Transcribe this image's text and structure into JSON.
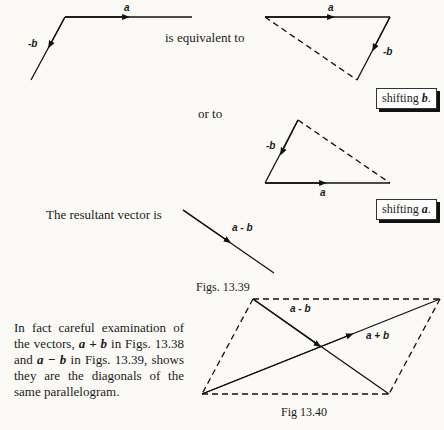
{
  "figure_1": {
    "label_a": "a",
    "label_neg_b": "-b",
    "text_equivalent": "is equivalent to"
  },
  "figure_2": {
    "label_a": "a",
    "label_neg_b": "-b",
    "note": {
      "prefix": "shifting ",
      "vector": "b",
      "suffix": "."
    }
  },
  "figure_3": {
    "text_or": "or to",
    "label_a": "a",
    "label_neg_b": "-b",
    "note": {
      "prefix": "shifting ",
      "vector": "a",
      "suffix": "."
    }
  },
  "resultant": {
    "text": "The resultant vector is",
    "label": "a - b"
  },
  "caption_1": "Figs. 13.39",
  "paragraph": {
    "part1": "In fact careful examination of the vectors, ",
    "v1": "a + b",
    "part2": " in Figs. 13.38 and ",
    "v2": "a − b",
    "part3": " in Figs. 13.39, shows they are the diagonals of the same parallelogram."
  },
  "figure_4": {
    "label_a_minus_b": "a - b",
    "label_a_plus_b": "a + b"
  },
  "caption_2": "Fig 13.40"
}
